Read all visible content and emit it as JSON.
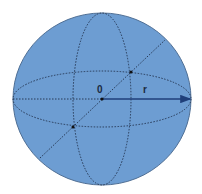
{
  "diagram": {
    "type": "sphere",
    "center_label": "0",
    "radius_label": "r",
    "colors": {
      "fill": "#6d9dd2",
      "outline": "#4f6f95",
      "lines": "#1f2f4a",
      "arrow": "#1f3f7a"
    }
  }
}
